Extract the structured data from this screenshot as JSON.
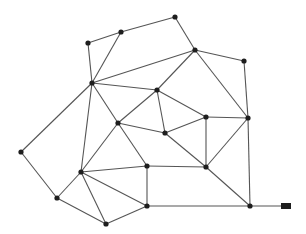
{
  "diagram": {
    "type": "undirected-graph",
    "colors": {
      "edge": "#555555",
      "node": "#1e1e1e",
      "background": "#ffffff"
    },
    "node_radius": 2.6,
    "nodes": [
      {
        "id": "A",
        "x": 88,
        "y": 43
      },
      {
        "id": "B",
        "x": 121,
        "y": 32
      },
      {
        "id": "C",
        "x": 175,
        "y": 17
      },
      {
        "id": "D",
        "x": 195,
        "y": 50
      },
      {
        "id": "E",
        "x": 244,
        "y": 61
      },
      {
        "id": "F",
        "x": 92,
        "y": 83
      },
      {
        "id": "G",
        "x": 157,
        "y": 90
      },
      {
        "id": "H",
        "x": 118,
        "y": 123
      },
      {
        "id": "I",
        "x": 165,
        "y": 133
      },
      {
        "id": "J",
        "x": 206,
        "y": 117
      },
      {
        "id": "K",
        "x": 248,
        "y": 118
      },
      {
        "id": "L",
        "x": 21,
        "y": 152
      },
      {
        "id": "M",
        "x": 81,
        "y": 172
      },
      {
        "id": "N",
        "x": 147,
        "y": 166
      },
      {
        "id": "O",
        "x": 206,
        "y": 167
      },
      {
        "id": "P",
        "x": 57,
        "y": 198
      },
      {
        "id": "Q",
        "x": 106,
        "y": 224
      },
      {
        "id": "R",
        "x": 147,
        "y": 206
      },
      {
        "id": "S",
        "x": 250,
        "y": 206
      }
    ],
    "terminal": {
      "id": "T",
      "x": 286,
      "y": 206,
      "width": 10,
      "height": 6
    },
    "edges": [
      [
        "A",
        "B"
      ],
      [
        "B",
        "C"
      ],
      [
        "C",
        "D"
      ],
      [
        "D",
        "E"
      ],
      [
        "E",
        "K"
      ],
      [
        "A",
        "F"
      ],
      [
        "B",
        "F"
      ],
      [
        "F",
        "D"
      ],
      [
        "F",
        "G"
      ],
      [
        "F",
        "L"
      ],
      [
        "F",
        "M"
      ],
      [
        "F",
        "H"
      ],
      [
        "D",
        "G"
      ],
      [
        "D",
        "K"
      ],
      [
        "G",
        "H"
      ],
      [
        "G",
        "I"
      ],
      [
        "G",
        "J"
      ],
      [
        "H",
        "I"
      ],
      [
        "H",
        "M"
      ],
      [
        "H",
        "N"
      ],
      [
        "I",
        "J"
      ],
      [
        "I",
        "O"
      ],
      [
        "J",
        "K"
      ],
      [
        "J",
        "O"
      ],
      [
        "K",
        "O"
      ],
      [
        "K",
        "S"
      ],
      [
        "L",
        "P"
      ],
      [
        "P",
        "M"
      ],
      [
        "P",
        "Q"
      ],
      [
        "M",
        "N"
      ],
      [
        "M",
        "R"
      ],
      [
        "M",
        "Q"
      ],
      [
        "N",
        "R"
      ],
      [
        "N",
        "O"
      ],
      [
        "Q",
        "R"
      ],
      [
        "R",
        "S"
      ],
      [
        "O",
        "S"
      ],
      [
        "S",
        "T"
      ]
    ]
  }
}
